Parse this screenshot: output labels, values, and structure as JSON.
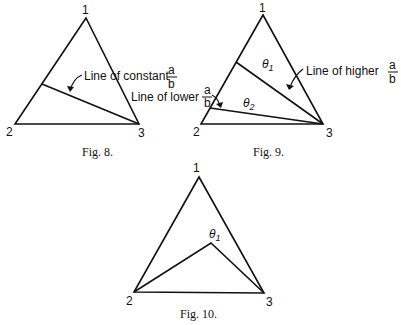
{
  "figures": [
    {
      "caption": "Fig. 8.",
      "vertices": {
        "top": "1",
        "left": "2",
        "right": "3"
      },
      "annotations": {
        "line_label": "Line of constant",
        "frac_num": "a",
        "frac_den": "b"
      }
    },
    {
      "caption": "Fig. 9.",
      "vertices": {
        "top": "1",
        "left": "2",
        "right": "3"
      },
      "annotations": {
        "higher_label": "Line of higher",
        "higher_num": "a",
        "higher_den": "b",
        "lower_label": "Line of lower",
        "lower_num": "a",
        "lower_den": "b",
        "theta1": "θ",
        "theta1_sub": "1",
        "theta2": "θ",
        "theta2_sub": "2"
      }
    },
    {
      "caption": "Fig. 10.",
      "vertices": {
        "top": "1",
        "left": "2",
        "right": "3"
      },
      "annotations": {
        "theta1": "θ",
        "theta1_sub": "1"
      }
    }
  ]
}
